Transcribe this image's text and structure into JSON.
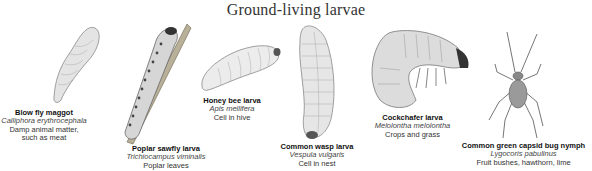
{
  "title": "Ground-living larvae",
  "larvae": [
    {
      "name": "Blow fly maggot",
      "species": "Calliphora erythrocephala",
      "habitat": "Damp animal matter,",
      "habitat2": "such as meat"
    },
    {
      "name": "Poplar sawfly larva",
      "species": "Trichiocampus viminalis",
      "habitat": "Poplar leaves"
    },
    {
      "name": "Honey bee larva",
      "species": "Apis mellifera",
      "habitat": "Cell in hive"
    },
    {
      "name": "Common wasp larva",
      "species": "Vespula vulgaris",
      "habitat": "Cell in nest"
    },
    {
      "name": "Cockchafer larva",
      "species": "Melolontha melolontha",
      "habitat": "Crops and grass"
    },
    {
      "name": "Common green capsid bug nymph",
      "species": "Lygocoris pabulinus",
      "habitat": "Fruit bushes, hawthorn, lime"
    }
  ]
}
